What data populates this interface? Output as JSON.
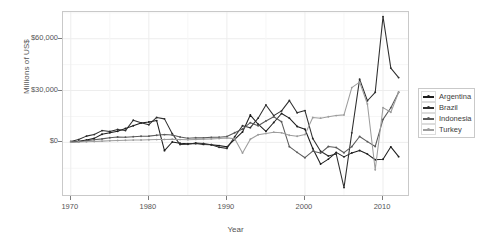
{
  "chart_data": {
    "type": "line",
    "title": "",
    "xlabel": "Year",
    "ylabel": "Millions of US$",
    "xlim": [
      1969,
      1913
    ],
    "x_ticks": [
      1970,
      1980,
      1990,
      2000,
      2010
    ],
    "y_ticks": [
      0,
      30000,
      60000
    ],
    "y_tick_labels": [
      "$0",
      "$30,000",
      "$60,000"
    ],
    "ylim": [
      -28000,
      74000
    ],
    "grid": true,
    "legend_position": "right",
    "x": [
      1970,
      1971,
      1972,
      1973,
      1974,
      1975,
      1976,
      1977,
      1978,
      1979,
      1980,
      1981,
      1982,
      1983,
      1984,
      1985,
      1986,
      1987,
      1988,
      1989,
      1990,
      1991,
      1992,
      1993,
      1994,
      1995,
      1996,
      1997,
      1998,
      1999,
      2000,
      2001,
      2002,
      2003,
      2004,
      2005,
      2006,
      2007,
      2008,
      2009,
      2010,
      2011,
      2012
    ],
    "series": [
      {
        "name": "Argentina",
        "color": "#1d1d1d",
        "values": [
          200,
          600,
          1400,
          2300,
          4700,
          5600,
          6400,
          8000,
          9600,
          11200,
          11800,
          12600,
          -4800,
          200,
          -500,
          -800,
          -700,
          -1200,
          -1400,
          -1900,
          -2600,
          1700,
          6000,
          15800,
          10500,
          6400,
          11500,
          16700,
          14000,
          9200,
          7600,
          -3600,
          -12600,
          -9700,
          -5800,
          -8400,
          -6100,
          -4700,
          -6800,
          -10100,
          -9800,
          -2600,
          -8300
        ]
      },
      {
        "name": "Brazil",
        "color": "#2e2e2e",
        "values": [
          500,
          1600,
          3600,
          4500,
          6800,
          6300,
          7400,
          6800,
          12800,
          11300,
          10200,
          14400,
          13600,
          5000,
          -1300,
          -1100,
          -400,
          -700,
          -1400,
          -2900,
          -3500,
          3200,
          9600,
          8500,
          14000,
          21600,
          15500,
          18200,
          24200,
          17100,
          18400,
          2200,
          -5200,
          -7900,
          -6700,
          -26200,
          5500,
          36600,
          24100,
          29000,
          72800,
          43000,
          37500
        ]
      },
      {
        "name": "Indonesia",
        "color": "#5a5a5a",
        "values": [
          150,
          400,
          900,
          1500,
          2000,
          2700,
          3100,
          3000,
          3300,
          3500,
          3600,
          4100,
          4500,
          4200,
          3100,
          2400,
          2700,
          2600,
          2900,
          3000,
          3400,
          5600,
          7700,
          11400,
          9600,
          12400,
          14800,
          11900,
          -2500,
          -5800,
          -8900,
          -5100,
          -6200,
          -2400,
          -3000,
          -6000,
          -2500,
          3400,
          400,
          -2400,
          13300,
          20000,
          29000
        ]
      },
      {
        "name": "Turkey",
        "color": "#9d9d9d",
        "values": [
          100,
          200,
          300,
          500,
          700,
          900,
          1100,
          1200,
          1300,
          1400,
          1500,
          1600,
          1700,
          1800,
          1600,
          1500,
          1700,
          1800,
          2000,
          2200,
          2600,
          2100,
          -6200,
          1800,
          4400,
          5100,
          5900,
          5500,
          4100,
          3500,
          4500,
          14400,
          14000,
          14800,
          15500,
          15900,
          31700,
          34900,
          22200,
          -15900,
          20100,
          17400,
          29000
        ]
      }
    ]
  },
  "legend": {
    "items": [
      {
        "label": "Argentina"
      },
      {
        "label": "Brazil"
      },
      {
        "label": "Indonesia"
      },
      {
        "label": "Turkey"
      }
    ]
  }
}
